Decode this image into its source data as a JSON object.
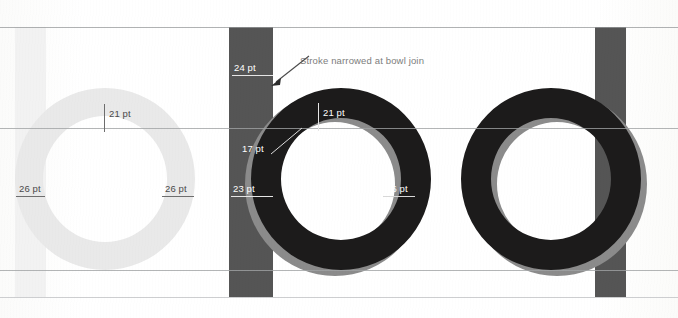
{
  "figure": {
    "annotation": "Stroke narrowed at bowl join",
    "background_color": "#ffffff",
    "colors": {
      "glyph_light": "#e9e9e9",
      "glyph_dark": "#1c1b1b",
      "ghost_gray": "#8b8b8b",
      "stem_bar_dark": "#5a5a5a",
      "stem_bar_light": "#f0f0f0",
      "guide_line": "#c9cacb",
      "label_dark": "#4a4a4a",
      "label_light": "#ffffff",
      "note_text": "#7d7d7d"
    }
  },
  "guides": [
    {
      "name": "ascender-line",
      "y": 27
    },
    {
      "name": "x-height-line",
      "y": 128
    },
    {
      "name": "baseline",
      "y": 270
    },
    {
      "name": "descender-line",
      "y": 297
    }
  ],
  "specimens": [
    {
      "id": "specimen-light-o",
      "letter": "o",
      "weight": "light",
      "measurements": [
        {
          "id": "light-o-top",
          "label": "21 pt",
          "value": 21,
          "unit": "pt",
          "position": "top-stroke",
          "tone": "dark"
        },
        {
          "id": "light-o-left",
          "label": "26 pt",
          "value": 26,
          "unit": "pt",
          "position": "left-stroke",
          "tone": "dark"
        },
        {
          "id": "light-o-right",
          "label": "26 pt",
          "value": 26,
          "unit": "pt",
          "position": "right-stroke",
          "tone": "dark"
        }
      ]
    },
    {
      "id": "specimen-bold-b",
      "letter": "b",
      "weight": "bold",
      "measurements": [
        {
          "id": "bold-b-stem",
          "label": "24 pt",
          "value": 24,
          "unit": "pt",
          "position": "stem",
          "tone": "light"
        },
        {
          "id": "bold-b-join",
          "label": "17 pt",
          "value": 17,
          "unit": "pt",
          "position": "bowl-join",
          "tone": "light"
        },
        {
          "id": "bold-b-left",
          "label": "23 pt",
          "value": 23,
          "unit": "pt",
          "position": "left-stroke",
          "tone": "light"
        },
        {
          "id": "bold-b-top",
          "label": "21 pt",
          "value": 21,
          "unit": "pt",
          "position": "top-stroke",
          "tone": "light"
        },
        {
          "id": "bold-b-right",
          "label": "26 pt",
          "value": 26,
          "unit": "pt",
          "position": "right-stroke",
          "tone": "light"
        }
      ]
    },
    {
      "id": "specimen-bold-o",
      "letter": "o",
      "weight": "bold",
      "measurements": []
    }
  ]
}
